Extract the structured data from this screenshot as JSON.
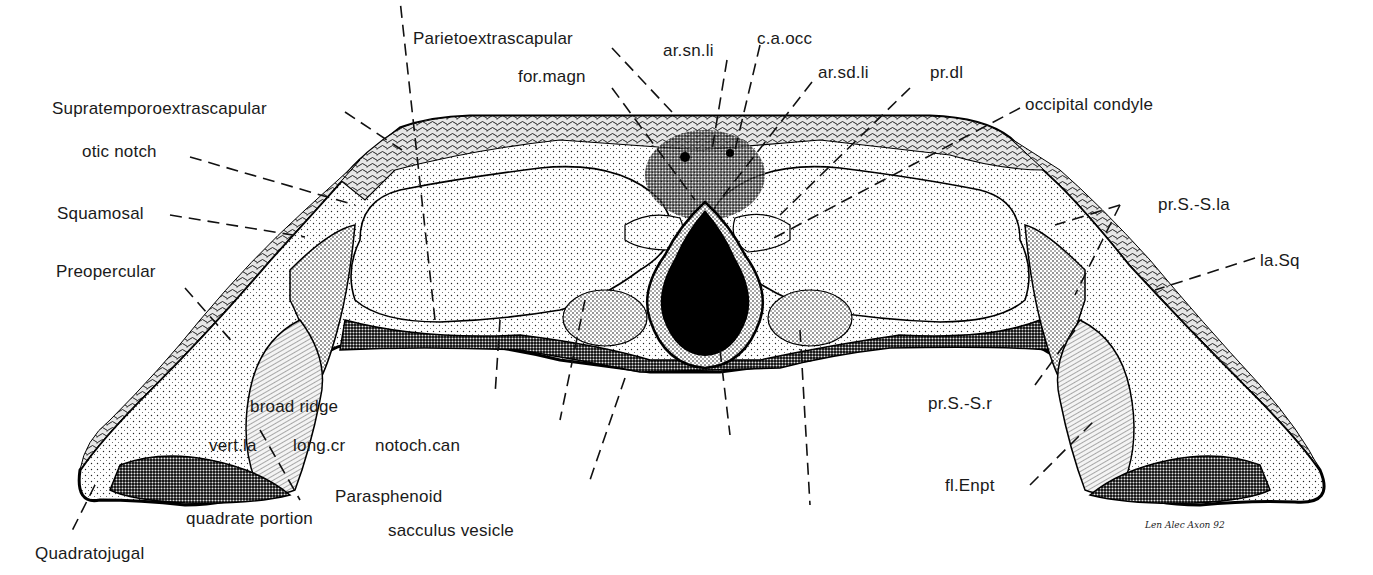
{
  "figure": {
    "signature": "Len Alec Axon 92",
    "colors": {
      "ink": "#111111",
      "paper": "#ffffff",
      "label_text": "#1a1a1a"
    }
  },
  "labels": {
    "parietoextrascapular": "Parietoextrascapular",
    "ar_sn_li": "ar.sn.li",
    "c_a_occ": "c.a.occ",
    "for_magn": "for.magn",
    "ar_sd_li": "ar.sd.li",
    "pr_dl": "pr.dl",
    "occipital_condyle": "occipital condyle",
    "supratemporoextrascapular": "Supratemporoextrascapular",
    "otic_notch": "otic notch",
    "squamosal": "Squamosal",
    "preopercular": "Preopercular",
    "pr_s_s_la": "pr.S.-S.la",
    "la_sq": "la.Sq",
    "pr_s_s_r": "pr.S.-S.r",
    "fl_enpt": "fl.Enpt",
    "broad_ridge": "broad ridge",
    "vert_la": "vert.la",
    "long_cr": "long.cr",
    "notoch_can": "notoch.can",
    "parasphenoid": "Parasphenoid",
    "sacculus_vesicle": "sacculus vesicle",
    "quadrate_portion": "quadrate portion",
    "quadratojugal": "Quadratojugal"
  }
}
